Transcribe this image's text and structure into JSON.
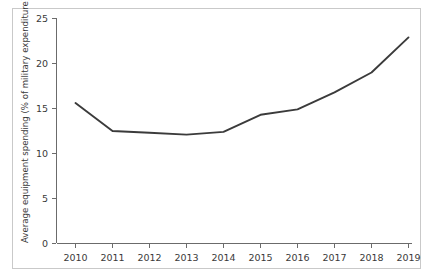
{
  "chart_data": {
    "type": "line",
    "title": "",
    "subtitle": "",
    "xlabel": "",
    "ylabel": "Average equipment spending (% of military expenditure)",
    "x": [
      2010,
      2011,
      2012,
      2013,
      2014,
      2015,
      2016,
      2017,
      2018,
      2019
    ],
    "categories": [
      "2010",
      "2011",
      "2012",
      "2013",
      "2014",
      "2015",
      "2016",
      "2017",
      "2018",
      "2019"
    ],
    "values": [
      15.6,
      12.5,
      12.3,
      12.1,
      12.4,
      14.3,
      14.9,
      16.8,
      19.0,
      22.9
    ],
    "series": [
      {
        "name": "Average equipment spending",
        "values": [
          15.6,
          12.5,
          12.3,
          12.1,
          12.4,
          14.3,
          14.9,
          16.8,
          19.0,
          22.9
        ],
        "color": "#3b3b3b"
      }
    ],
    "ylim": [
      0,
      25
    ],
    "xlim": [
      2010,
      2019
    ],
    "yticks": [
      0,
      5,
      10,
      15,
      20,
      25
    ],
    "ytick_labels": [
      "0",
      "5",
      "10",
      "15",
      "20",
      "25"
    ],
    "xticks": [
      2010,
      2011,
      2012,
      2013,
      2014,
      2015,
      2016,
      2017,
      2018,
      2019
    ],
    "xtick_labels": [
      "2010",
      "2011",
      "2012",
      "2013",
      "2014",
      "2015",
      "2016",
      "2017",
      "2018",
      "2019"
    ],
    "grid": false,
    "legend": false,
    "legend_position": "none",
    "annotations": [],
    "line_color": "#3b3b3b",
    "axis_color": "#6b6b6b",
    "border_color": "#c9c9c9",
    "background_color": "#ffffff"
  },
  "figure": {
    "y_axis_title": "Average equipment spending (% of military expenditure)",
    "ytick_0": "0",
    "ytick_1": "5",
    "ytick_2": "10",
    "ytick_3": "15",
    "ytick_4": "20",
    "ytick_5": "25",
    "xtick_0": "2010",
    "xtick_1": "2011",
    "xtick_2": "2012",
    "xtick_3": "2013",
    "xtick_4": "2014",
    "xtick_5": "2015",
    "xtick_6": "2016",
    "xtick_7": "2017",
    "xtick_8": "2018",
    "xtick_9": "2019"
  }
}
